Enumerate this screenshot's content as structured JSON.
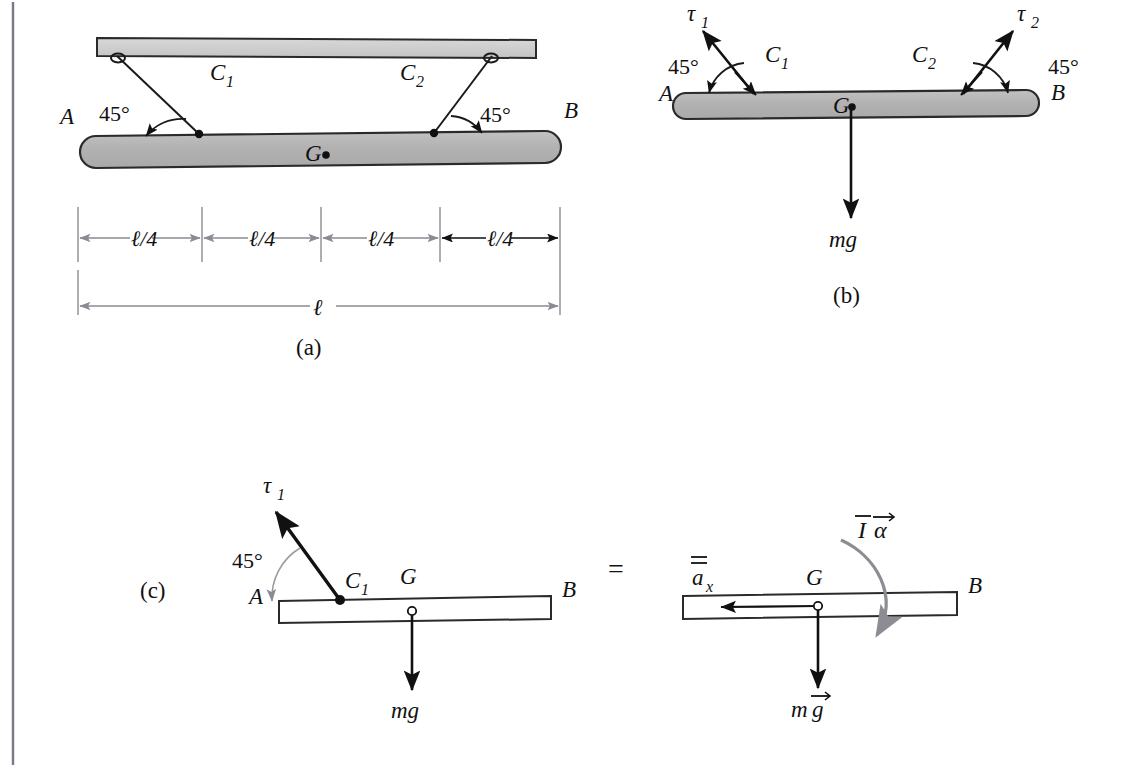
{
  "figure": {
    "caption_a": "(a)",
    "caption_b": "(b)",
    "caption_c": "(c)",
    "equals_sign": "=",
    "colors": {
      "bar_fill": "#b4b4b4",
      "ceiling_fill": "#cccccc",
      "stroke": "#111111",
      "dimension_line": "#8a8a93",
      "curved_arrow": "#8c8c92",
      "page_border": "#7a7a82"
    }
  },
  "panel_a": {
    "label_A": "A",
    "label_B": "B",
    "label_G": "G",
    "cable_1": "C",
    "cable_1_sub": "1",
    "cable_2": "C",
    "cable_2_sub": "2",
    "angle_left": "45°",
    "angle_right": "45°",
    "dimensions": {
      "segments": [
        "ℓ/4",
        "ℓ/4",
        "ℓ/4",
        "ℓ/4"
      ],
      "total": "ℓ"
    }
  },
  "panel_b": {
    "label_A": "A",
    "label_B": "B",
    "label_G": "G",
    "cable_1": "C",
    "cable_1_sub": "1",
    "cable_2": "C",
    "cable_2_sub": "2",
    "tension_1": "τ",
    "tension_1_sub": "1",
    "tension_2": "τ",
    "tension_2_sub": "2",
    "angle_left": "45°",
    "angle_right": "45°",
    "weight": "mg"
  },
  "panel_c_free_body": {
    "label_A": "A",
    "label_B": "B",
    "label_G": "G",
    "cable_1": "C",
    "cable_1_sub": "1",
    "tension_1": "τ",
    "tension_1_sub": "1",
    "angle": "45°",
    "weight": "mg"
  },
  "panel_c_kinetic": {
    "label_B": "B",
    "label_G": "G",
    "accel_x": "a",
    "accel_x_sub": "x",
    "inertia_moment": "I",
    "angular_accel": "α",
    "weight_m": "m",
    "weight_g": "g"
  }
}
